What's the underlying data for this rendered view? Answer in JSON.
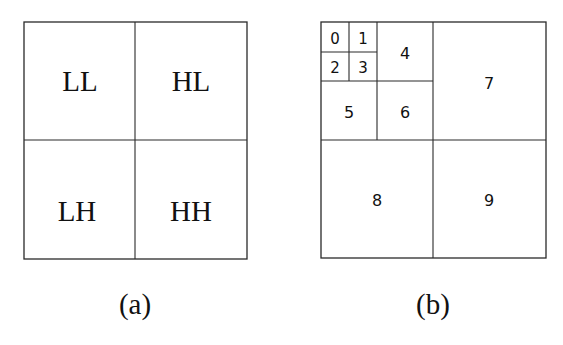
{
  "panel_a": {
    "caption": "(a)",
    "subbands": {
      "top_left": "LL",
      "top_right": "HL",
      "bottom_left": "LH",
      "bottom_right": "HH"
    }
  },
  "panel_b": {
    "caption": "(b)",
    "subbands": [
      "0",
      "1",
      "2",
      "3",
      "4",
      "5",
      "6",
      "7",
      "8",
      "9"
    ]
  }
}
